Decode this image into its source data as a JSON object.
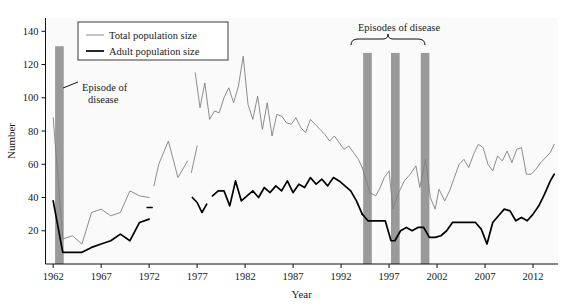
{
  "chart_data": {
    "type": "line",
    "title": "",
    "xlabel": "Year",
    "ylabel": "Number",
    "xlim": [
      1961.2,
      2014.6
    ],
    "ylim": [
      0,
      148
    ],
    "xticks": [
      1962,
      1967,
      1972,
      1977,
      1982,
      1987,
      1992,
      1997,
      2002,
      2007,
      2012
    ],
    "xtick_labels": [
      "1962",
      "1967",
      "1972",
      "1977",
      "1982",
      "1987",
      "1992",
      "1997",
      "2002",
      "2007",
      "2012"
    ],
    "yticks": [
      20,
      40,
      60,
      80,
      100,
      120,
      140
    ],
    "ytick_labels": [
      "20",
      "40",
      "60",
      "80",
      "100",
      "120",
      "140"
    ],
    "grid": false,
    "legend_position": "top-left",
    "series": [
      {
        "name": "Total population size",
        "color": "#808080",
        "width": 0.9,
        "segments": [
          {
            "x": [
              1962,
              1963,
              1964,
              1965,
              1966,
              1967,
              1968,
              1969,
              1970,
              1971,
              1972
            ],
            "y": [
              88,
              15,
              17,
              12,
              31,
              33,
              29,
              31,
              44,
              41,
              40
            ]
          },
          {
            "x": [
              1972.5,
              1973,
              1974,
              1975,
              1976
            ],
            "y": [
              47,
              60,
              74,
              52,
              62
            ]
          },
          {
            "x": [
              1976.4,
              1977
            ],
            "y": [
              55,
              71
            ]
          },
          {
            "x": [
              1976.8,
              1977.3,
              1977.8,
              1978.3,
              1978.8,
              1979.3,
              1979.8,
              1980.3,
              1980.8,
              1981.3,
              1981.8,
              1982.3,
              1982.8,
              1983.3,
              1983.8,
              1984.3,
              1984.8,
              1985.3,
              1985.8,
              1986.3,
              1986.8,
              1987.3,
              1987.8,
              1988.3,
              1988.8,
              1989.3,
              1989.8,
              1990.3,
              1990.8,
              1991.3,
              1991.8,
              1992.3,
              1992.8,
              1993.3,
              1993.8,
              1994.2
            ],
            "y": [
              115,
              94,
              109,
              87,
              92,
              91,
              100,
              106,
              97,
              107,
              125,
              96,
              87,
              101,
              81,
              97,
              77,
              90,
              89,
              85,
              84,
              88,
              82,
              79,
              87,
              84,
              81,
              78,
              74,
              77,
              73,
              69,
              71,
              67,
              63,
              58
            ]
          },
          {
            "x": [
              1994.2,
              1995,
              1995.6,
              1996,
              1996.5,
              1997,
              1997.4,
              1998,
              1998.6,
              1999.2,
              1999.8,
              2000.2,
              2000.8,
              2001.3,
              2001.8,
              2002.2,
              2002.8,
              2003.3,
              2003.8,
              2004.3,
              2004.8,
              2005.3,
              2005.8,
              2006.3,
              2006.8,
              2007.3,
              2007.8,
              2008.3,
              2008.8,
              2009.3,
              2009.8,
              2010.3,
              2010.8,
              2011.3,
              2011.8,
              2012.3,
              2012.8,
              2013.3,
              2013.8,
              2014.2
            ],
            "y": [
              58,
              43,
              41,
              45,
              52,
              56,
              33,
              43,
              50,
              54,
              59,
              46,
              63,
              40,
              33,
              45,
              38,
              44,
              52,
              60,
              63,
              58,
              66,
              72,
              70,
              60,
              56,
              65,
              62,
              68,
              61,
              69,
              70,
              54,
              54,
              57,
              61,
              64,
              67,
              72
            ]
          }
        ]
      },
      {
        "name": "Adult population size",
        "color": "#000000",
        "width": 1.7,
        "segments": [
          {
            "x": [
              1962,
              1963,
              1964,
              1965,
              1966,
              1967,
              1968,
              1969,
              1970,
              1971,
              1972
            ],
            "y": [
              38,
              7,
              7,
              7,
              10,
              12,
              14,
              18,
              14,
              25,
              27
            ]
          },
          {
            "x": [
              1971.8,
              1972.3
            ],
            "y": [
              34,
              34
            ]
          },
          {
            "x": [
              1976.5,
              1977,
              1977.5,
              1978
            ],
            "y": [
              40,
              37,
              31,
              36
            ]
          },
          {
            "x": [
              1978.6,
              1979.2,
              1979.8,
              1980.4,
              1981,
              1981.6,
              1982.2,
              1982.8,
              1983.4,
              1984,
              1984.6,
              1985.2,
              1985.8,
              1986.4,
              1987,
              1987.6,
              1988.2,
              1988.8,
              1989.4,
              1990,
              1990.6,
              1991.2,
              1991.8,
              1992.4,
              1993,
              1993.6,
              1994.2
            ],
            "y": [
              41,
              44,
              44,
              35,
              50,
              38,
              41,
              44,
              40,
              46,
              43,
              47,
              44,
              50,
              43,
              48,
              46,
              52,
              48,
              51,
              47,
              52,
              50,
              47,
              44,
              38,
              30
            ]
          },
          {
            "x": [
              1994.2,
              1994.8,
              1995.4,
              1996,
              1996.6,
              1997.2,
              1997.6,
              1998.2,
              1998.8,
              1999.4,
              2000,
              2000.6,
              2001.2,
              2001.8,
              2002.4,
              2003,
              2003.6,
              2004.2,
              2004.8,
              2005.4,
              2006,
              2006.6,
              2007.2,
              2007.8,
              2008.4,
              2009,
              2009.6,
              2010.2,
              2010.8,
              2011.4,
              2012,
              2012.6,
              2013.2,
              2013.8,
              2014.2
            ],
            "y": [
              30,
              26,
              26,
              26,
              26,
              14,
              14,
              20,
              22,
              20,
              22,
              22,
              16,
              16,
              17,
              20,
              25,
              25,
              25,
              25,
              25,
              21,
              12,
              25,
              29,
              33,
              32,
              26,
              28,
              26,
              30,
              35,
              42,
              50,
              54
            ]
          }
        ]
      }
    ],
    "disease_bands": [
      {
        "x_start": 1962.2,
        "x_end": 1963.1,
        "y_top": 131,
        "color": "#9a9a9a"
      },
      {
        "x_start": 1994.3,
        "x_end": 1995.2,
        "y_top": 127,
        "color": "#9a9a9a"
      },
      {
        "x_start": 1997.2,
        "x_end": 1998.1,
        "y_top": 127,
        "color": "#9a9a9a"
      },
      {
        "x_start": 2000.3,
        "x_end": 2001.2,
        "y_top": 127,
        "color": "#9a9a9a"
      }
    ],
    "annotations": [
      {
        "id": "episode-single",
        "text_line1": "Episode of",
        "text_line2": "disease",
        "text_x": 82,
        "text_y": 91,
        "leader": [
          [
            63,
            88
          ],
          [
            78,
            82
          ]
        ]
      },
      {
        "id": "episodes-multi",
        "text": "Episodes of disease",
        "text_x": 399,
        "text_y": 31,
        "brace_left": 351,
        "brace_right": 425,
        "brace_y": 39
      }
    ]
  },
  "plot_geometry": {
    "left": 45.5,
    "right": 558,
    "top": 18,
    "bottom": 264,
    "x0_year": 1961.2,
    "x1_year": 2014.6,
    "y0_value": 0,
    "y1_value": 148
  }
}
